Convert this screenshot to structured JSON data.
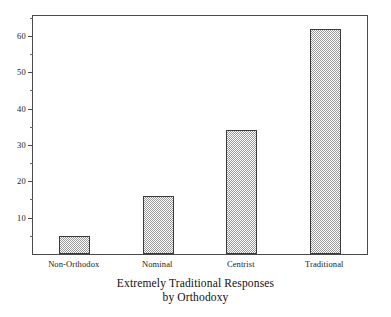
{
  "chart_data": {
    "type": "bar",
    "title": "",
    "caption_line1": "Extremely Traditional Responses",
    "caption_line2": "by Orthodoxy",
    "xlabel": "",
    "ylabel": "",
    "categories": [
      "Non-Orthodox",
      "Nominal",
      "Centrist",
      "Traditional"
    ],
    "values": [
      5,
      16,
      34,
      62
    ],
    "ylim": [
      0,
      65.5
    ],
    "xlim": [
      0,
      4
    ],
    "y_major_ticks": [
      10,
      20,
      30,
      40,
      50,
      60
    ],
    "y_minor_ticks": [
      5,
      15,
      25,
      35,
      45,
      55,
      65
    ],
    "y_tick_labels": [
      "10",
      "20",
      "30",
      "40",
      "50",
      "60"
    ],
    "grid": false,
    "legend": null,
    "bar_fill": "checkerboard-dither-gray",
    "bar_fill_color": "#9a9a9a",
    "bar_edge_color": "#3a3a3a",
    "frame_color": "#4a4a4a",
    "background_color": "#ffffff",
    "series": [
      {
        "name": "Extremely Traditional Responses",
        "values": [
          5,
          16,
          34,
          62
        ]
      }
    ],
    "points": [
      {
        "category": "Non-Orthodox",
        "value": 5
      },
      {
        "category": "Nominal",
        "value": 16
      },
      {
        "category": "Centrist",
        "value": 34
      },
      {
        "category": "Traditional",
        "value": 62
      }
    ]
  }
}
